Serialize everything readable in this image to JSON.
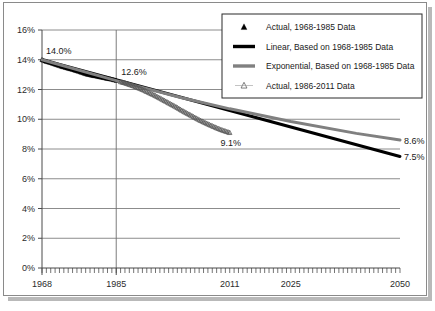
{
  "chart_data": {
    "type": "line",
    "title": "",
    "subtitle": "",
    "xlabel": "",
    "ylabel": "",
    "xlim": [
      1968,
      2050
    ],
    "ylim": [
      0,
      16
    ],
    "grid": true,
    "legend_position": "top-right",
    "y_ticks": [
      "0%",
      "2%",
      "4%",
      "6%",
      "8%",
      "10%",
      "12%",
      "14%",
      "16%"
    ],
    "y_tick_values": [
      0,
      2,
      4,
      6,
      8,
      10,
      12,
      14,
      16
    ],
    "x_ticks": [
      "1968",
      "1985",
      "2011",
      "2025",
      "2050"
    ],
    "x_tick_values": [
      1968,
      1985,
      2011,
      2025,
      2050
    ],
    "annotations": [
      {
        "text": "14.0%",
        "x": 1968,
        "y": 14.0
      },
      {
        "text": "12.6%",
        "x": 1985,
        "y": 12.6
      },
      {
        "text": "9.1%",
        "x": 2011,
        "y": 9.1
      },
      {
        "text": "8.6%",
        "x": 2050,
        "y": 8.6
      },
      {
        "text": "7.5%",
        "x": 2050,
        "y": 7.5
      }
    ],
    "series": [
      {
        "name": "Actual, 1968-1985 Data",
        "type": "scatter",
        "marker": "filled-triangle",
        "color": "#000000",
        "x": [
          1968,
          1969,
          1970,
          1971,
          1972,
          1973,
          1974,
          1975,
          1976,
          1977,
          1978,
          1979,
          1980,
          1981,
          1982,
          1983,
          1984,
          1985
        ],
        "values": [
          14.0,
          13.88,
          13.8,
          13.7,
          13.6,
          13.5,
          13.42,
          13.34,
          13.25,
          13.15,
          13.05,
          12.98,
          12.92,
          12.86,
          12.8,
          12.74,
          12.68,
          12.6
        ]
      },
      {
        "name": "Linear, Based on 1968-1985 Data",
        "type": "line",
        "color": "#000000",
        "width": 3,
        "x": [
          1968,
          2050
        ],
        "values": [
          14.0,
          7.5
        ]
      },
      {
        "name": "Exponential, Based on 1968-1985 Data",
        "type": "line",
        "color": "#808080",
        "width": 3,
        "x": [
          1968,
          1985,
          2000,
          2011,
          2025,
          2040,
          2050
        ],
        "values": [
          14.0,
          12.6,
          11.45,
          10.7,
          9.85,
          9.05,
          8.6
        ]
      },
      {
        "name": "Actual, 1986-2011 Data",
        "type": "scatter",
        "marker": "hollow-triangle",
        "color": "#555555",
        "x": [
          1986,
          1987,
          1988,
          1989,
          1990,
          1991,
          1992,
          1993,
          1994,
          1995,
          1996,
          1997,
          1998,
          1999,
          2000,
          2001,
          2002,
          2003,
          2004,
          2005,
          2006,
          2007,
          2008,
          2009,
          2010,
          2011
        ],
        "values": [
          12.52,
          12.44,
          12.34,
          12.24,
          12.12,
          12.0,
          11.86,
          11.72,
          11.58,
          11.42,
          11.26,
          11.1,
          10.94,
          10.78,
          10.6,
          10.44,
          10.28,
          10.12,
          9.96,
          9.82,
          9.68,
          9.55,
          9.42,
          9.3,
          9.2,
          9.1
        ]
      }
    ]
  },
  "legend": {
    "items": [
      {
        "label": "Actual, 1968-1985 Data",
        "marker": "filled-triangle",
        "color": "#000000"
      },
      {
        "label": "Linear, Based on 1968-1985 Data",
        "marker": "thick-line",
        "color": "#000000"
      },
      {
        "label": "Exponential, Based on 1968-1985 Data",
        "marker": "thick-line",
        "color": "#808080"
      },
      {
        "label": "Actual, 1986-2011 Data",
        "marker": "hollow-triangle",
        "color": "#555555"
      }
    ]
  },
  "colors": {
    "axis": "#4a4a4a",
    "grid": "#6e6e6e",
    "frame": "#8a8a8a",
    "linear": "#000000",
    "exponential": "#808080",
    "shadow": "#b9b9b9",
    "background": "#ffffff"
  }
}
